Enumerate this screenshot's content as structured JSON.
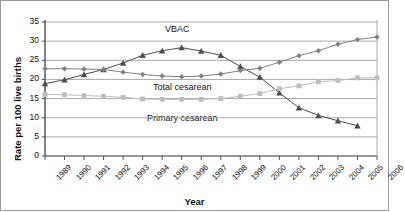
{
  "chart_data": {
    "type": "line",
    "title": "",
    "xlabel": "Year",
    "ylabel": "Rate per 100 live births",
    "categories": [
      1989,
      1990,
      1991,
      1992,
      1993,
      1994,
      1995,
      1996,
      1997,
      1998,
      1999,
      2000,
      2001,
      2002,
      2003,
      2004,
      2005,
      2006
    ],
    "x_tick_labels": [
      "1989",
      "1990",
      "1991",
      "1992",
      "1993",
      "1994",
      "1995",
      "1996",
      "1997",
      "1998",
      "1999",
      "2000",
      "2001",
      "2002",
      "2003",
      "2004",
      "2005",
      "2006"
    ],
    "y_tick_labels": [
      "0",
      "5",
      "10",
      "15",
      "20",
      "25",
      "30",
      "35"
    ],
    "ylim": [
      0,
      35
    ],
    "y_tick_step": 5,
    "grid": "horizontal",
    "legend_position": "inline-annotations",
    "series": [
      {
        "name": "VBAC",
        "marker": "triangle",
        "color": "#4d4d4d",
        "label_text": "VBAC",
        "x": [
          1989,
          1990,
          1991,
          1992,
          1993,
          1994,
          1995,
          1996,
          1997,
          1998,
          1999,
          2000,
          2001,
          2002,
          2003,
          2004,
          2005
        ],
        "values": [
          18.9,
          19.9,
          21.3,
          22.6,
          24.3,
          26.3,
          27.5,
          28.3,
          27.4,
          26.3,
          23.4,
          20.6,
          16.5,
          12.6,
          10.6,
          9.2,
          7.9
        ]
      },
      {
        "name": "Total cesarean",
        "marker": "diamond",
        "color": "#808080",
        "label_text": "Total cesarean",
        "x": [
          1989,
          1990,
          1991,
          1992,
          1993,
          1994,
          1995,
          1996,
          1997,
          1998,
          1999,
          2000,
          2001,
          2002,
          2003,
          2004,
          2005,
          2006
        ],
        "values": [
          22.8,
          22.8,
          22.7,
          22.6,
          21.9,
          21.3,
          20.9,
          20.7,
          20.9,
          21.4,
          22.3,
          22.9,
          24.5,
          26.2,
          27.5,
          29.2,
          30.4,
          31.1
        ]
      },
      {
        "name": "Primary cesarean",
        "marker": "square",
        "color": "#bdbdbd",
        "label_text": "Primary cesarean",
        "x": [
          1989,
          1990,
          1991,
          1992,
          1993,
          1994,
          1995,
          1996,
          1997,
          1998,
          1999,
          2000,
          2001,
          2002,
          2003,
          2004,
          2005,
          2006
        ],
        "values": [
          16.1,
          16.0,
          15.8,
          15.6,
          15.3,
          14.9,
          14.8,
          14.8,
          14.8,
          15.0,
          15.6,
          16.3,
          17.6,
          18.3,
          19.4,
          19.7,
          20.4,
          20.4
        ]
      }
    ],
    "annotations": [
      {
        "text": "VBAC",
        "series": "VBAC"
      },
      {
        "text": "Total cesarean",
        "series": "Total cesarean"
      },
      {
        "text": "Primary cesarean",
        "series": "Primary cesarean"
      }
    ]
  },
  "colors": {
    "grid": "#aaaaaa",
    "axis": "#555555",
    "border": "#9a9a9a",
    "background": "#ffffff",
    "text": "#111111"
  }
}
